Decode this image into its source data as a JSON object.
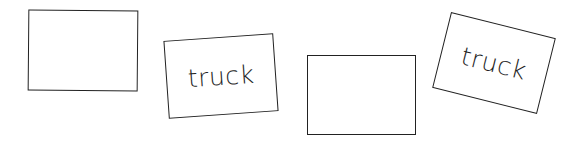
{
  "cards": [
    {
      "id": "card-1",
      "label": ""
    },
    {
      "id": "card-2",
      "label": "truck"
    },
    {
      "id": "card-3",
      "label": ""
    },
    {
      "id": "card-4",
      "label": "truck"
    }
  ],
  "colors": {
    "stroke": "#222222",
    "background": "#ffffff",
    "text": "#1f1f1f"
  }
}
